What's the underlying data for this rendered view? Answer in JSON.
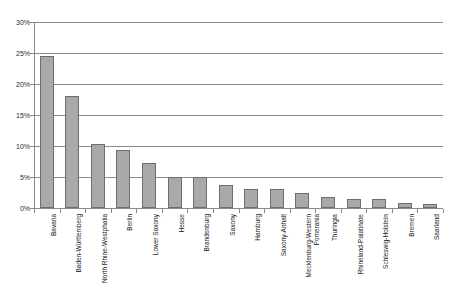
{
  "chart_data": {
    "type": "bar",
    "title": "",
    "subtitle": "",
    "xlabel": "",
    "ylabel": "",
    "ylim": [
      0,
      30
    ],
    "ytick_values": [
      0,
      5,
      10,
      15,
      20,
      25,
      30
    ],
    "ytick_labels": [
      "0%",
      "5%",
      "10%",
      "15%",
      "20%",
      "25%",
      "30%"
    ],
    "grid": true,
    "legend": null,
    "orientation": "vertical",
    "bar_color": "#a9a9a9",
    "bar_border_color": "#6e6e6e",
    "axis_color": "#8a8a8a",
    "categories": [
      "Bavaria",
      "Baden-Württemberg",
      "North Rhine-Westphalia",
      "Berlin",
      "Lower Saxony",
      "Hesse",
      "Brandenburg",
      "Saxony",
      "Hamburg",
      "Saxony-Anhalt",
      "Mecklenburg-Western\nPomerania",
      "Thuringia",
      "Rhineland-Palatinate",
      "Schleswig-Holstein",
      "Bremen",
      "Saarland"
    ],
    "values": [
      24.5,
      18.0,
      10.4,
      9.3,
      7.3,
      5.0,
      5.0,
      3.7,
      3.0,
      3.0,
      2.5,
      1.8,
      1.4,
      1.4,
      0.8,
      0.7
    ]
  }
}
